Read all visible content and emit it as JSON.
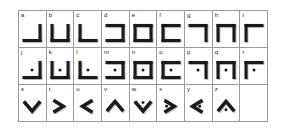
{
  "chart": {
    "type": "table",
    "columns": 9,
    "rows": 3,
    "colors": {
      "stroke": "#1a1a1a",
      "shadow": "#b9b9b9",
      "grid": "#9a9a9a",
      "background": "#ffffff",
      "label": "#1d1d1d"
    },
    "cells": [
      [
        {
          "label": "a",
          "shape": "corner-bottom-right",
          "dot": false
        },
        {
          "label": "b",
          "shape": "u-open-top",
          "dot": false
        },
        {
          "label": "c",
          "shape": "corner-bottom-left",
          "dot": false
        },
        {
          "label": "d",
          "shape": "u-open-left",
          "dot": false
        },
        {
          "label": "e",
          "shape": "square-closed",
          "dot": false
        },
        {
          "label": "f",
          "shape": "u-open-right",
          "dot": false
        },
        {
          "label": "g",
          "shape": "corner-top-right",
          "dot": false
        },
        {
          "label": "h",
          "shape": "u-open-bottom",
          "dot": false
        },
        {
          "label": "i",
          "shape": "corner-top-left",
          "dot": false
        }
      ],
      [
        {
          "label": "j",
          "shape": "corner-bottom-right",
          "dot": true
        },
        {
          "label": "k",
          "shape": "u-open-top",
          "dot": true
        },
        {
          "label": "l",
          "shape": "corner-bottom-left",
          "dot": true
        },
        {
          "label": "m",
          "shape": "u-open-left",
          "dot": true
        },
        {
          "label": "n",
          "shape": "square-closed",
          "dot": true
        },
        {
          "label": "o",
          "shape": "u-open-right",
          "dot": true
        },
        {
          "label": "p",
          "shape": "corner-top-right",
          "dot": true
        },
        {
          "label": "q",
          "shape": "u-open-bottom",
          "dot": true
        },
        {
          "label": "r",
          "shape": "corner-top-left",
          "dot": true
        }
      ],
      [
        {
          "label": "s",
          "shape": "chevron-down",
          "dot": false
        },
        {
          "label": "t",
          "shape": "chevron-right",
          "dot": false
        },
        {
          "label": "u",
          "shape": "chevron-left",
          "dot": false
        },
        {
          "label": "v",
          "shape": "chevron-up",
          "dot": false
        },
        {
          "label": "w",
          "shape": "chevron-down",
          "dot": true
        },
        {
          "label": "x",
          "shape": "chevron-right",
          "dot": true
        },
        {
          "label": "y",
          "shape": "chevron-left",
          "dot": true
        },
        {
          "label": "z",
          "shape": "chevron-up",
          "dot": true
        },
        {
          "label": "",
          "shape": "empty",
          "dot": false
        }
      ]
    ]
  }
}
